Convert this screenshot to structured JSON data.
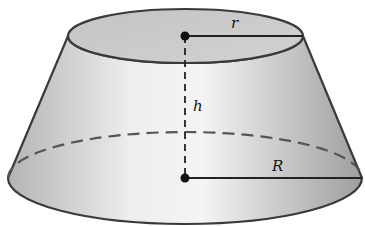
{
  "diagram": {
    "shape": "conical frustum",
    "labels": {
      "top_radius": "r",
      "height": "h",
      "bottom_radius": "R"
    },
    "colors": {
      "outline": "#3a3a3a",
      "top_face": "#c8c8c8",
      "side_light": "#f2f2f2",
      "side_dark": "#a8a8a8",
      "dot": "#111111"
    }
  }
}
